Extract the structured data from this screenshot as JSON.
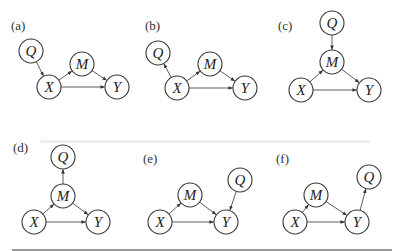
{
  "figure": {
    "panels": [
      {
        "label": "(a)",
        "nodes": [
          {
            "id": "Q",
            "text": "Q"
          },
          {
            "id": "X",
            "text": "X"
          },
          {
            "id": "M",
            "text": "M"
          },
          {
            "id": "Y",
            "text": "Y"
          }
        ],
        "edges": [
          [
            "Q",
            "X"
          ],
          [
            "X",
            "M"
          ],
          [
            "M",
            "Y"
          ],
          [
            "X",
            "Y"
          ]
        ]
      },
      {
        "label": "(b)",
        "nodes": [
          {
            "id": "Q",
            "text": "Q"
          },
          {
            "id": "X",
            "text": "X"
          },
          {
            "id": "M",
            "text": "M"
          },
          {
            "id": "Y",
            "text": "Y"
          }
        ],
        "edges": [
          [
            "X",
            "Q"
          ],
          [
            "X",
            "M"
          ],
          [
            "M",
            "Y"
          ],
          [
            "X",
            "Y"
          ]
        ]
      },
      {
        "label": "(c)",
        "nodes": [
          {
            "id": "Q",
            "text": "Q"
          },
          {
            "id": "M",
            "text": "M"
          },
          {
            "id": "X",
            "text": "X"
          },
          {
            "id": "Y",
            "text": "Y"
          }
        ],
        "edges": [
          [
            "Q",
            "M"
          ],
          [
            "X",
            "M"
          ],
          [
            "M",
            "Y"
          ],
          [
            "X",
            "Y"
          ]
        ]
      },
      {
        "label": "(d)",
        "nodes": [
          {
            "id": "Q",
            "text": "Q"
          },
          {
            "id": "M",
            "text": "M"
          },
          {
            "id": "X",
            "text": "X"
          },
          {
            "id": "Y",
            "text": "Y"
          }
        ],
        "edges": [
          [
            "M",
            "Q"
          ],
          [
            "X",
            "M"
          ],
          [
            "M",
            "Y"
          ],
          [
            "X",
            "Y"
          ]
        ]
      },
      {
        "label": "(e)",
        "nodes": [
          {
            "id": "M",
            "text": "M"
          },
          {
            "id": "Q",
            "text": "Q"
          },
          {
            "id": "X",
            "text": "X"
          },
          {
            "id": "Y",
            "text": "Y"
          }
        ],
        "edges": [
          [
            "Q",
            "Y"
          ],
          [
            "X",
            "M"
          ],
          [
            "M",
            "Y"
          ],
          [
            "X",
            "Y"
          ]
        ]
      },
      {
        "label": "(f)",
        "nodes": [
          {
            "id": "M",
            "text": "M"
          },
          {
            "id": "Q",
            "text": "Q"
          },
          {
            "id": "X",
            "text": "X"
          },
          {
            "id": "Y",
            "text": "Y"
          }
        ],
        "edges": [
          [
            "Y",
            "Q"
          ],
          [
            "X",
            "M"
          ],
          [
            "M",
            "Y"
          ],
          [
            "X",
            "Y"
          ]
        ]
      }
    ]
  }
}
